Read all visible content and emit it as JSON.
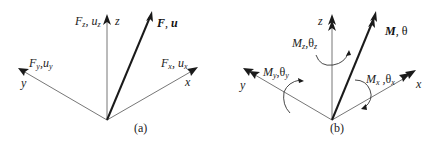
{
  "figure": {
    "panel_a": {
      "caption": "(a)",
      "axes": {
        "z": "z",
        "y": "y",
        "x": "x"
      },
      "labels": {
        "fz": {
          "main": "F",
          "sub": "z",
          "sep": ", ",
          "main2": "u",
          "sub2": "z"
        },
        "fy": {
          "main": "F",
          "sub": "y",
          "sep": ",",
          "main2": "u",
          "sub2": "y"
        },
        "fx": {
          "main": "F",
          "sub": "x",
          "sep": ", ",
          "main2": "u",
          "sub2": "x"
        },
        "resultant": {
          "text1": "F",
          "sep": ", ",
          "text2": "u"
        }
      }
    },
    "panel_b": {
      "caption": "(b)",
      "axes": {
        "z": "z",
        "y": "y",
        "x": "x"
      },
      "labels": {
        "mz": {
          "main": "M",
          "sub": "z",
          "sep": ",",
          "main2": "θ",
          "sub2": "z"
        },
        "my": {
          "main": "M",
          "sub": "y",
          "sep": ",",
          "main2": "θ",
          "sub2": "y"
        },
        "mx": {
          "main": "M",
          "sub": "x",
          "sep": " ,",
          "main2": "θ",
          "sub2": "x"
        },
        "resultant": {
          "text1": "M",
          "sep": ", ",
          "text2": "θ"
        }
      }
    },
    "colors": {
      "axis": "#777777",
      "resultant": "#1a1a1a",
      "text": "#222222"
    }
  }
}
